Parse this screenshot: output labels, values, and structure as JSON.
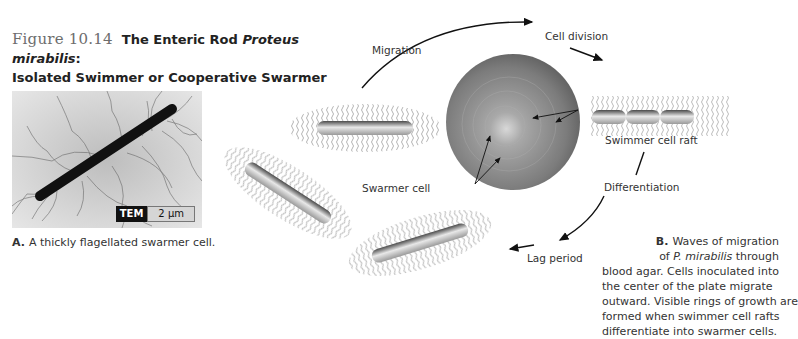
{
  "figure": {
    "number": "Figure 10.14",
    "title_prefix": "The Enteric Rod ",
    "title_italic": "Proteus mirabilis",
    "title_suffix": ":",
    "title_line2": "Isolated Swimmer or Cooperative Swarmer"
  },
  "panel_a": {
    "badge_method": "TEM",
    "badge_scale": "2 μm",
    "caption_letter": "A.",
    "caption_text": "A thickly flagellated swarmer cell."
  },
  "cycle_labels": {
    "migration": "Migration",
    "cell_division": "Cell division",
    "swimmer_cell_raft": "Swimmer cell raft",
    "differentiation": "Differentiation",
    "lag_period": "Lag period",
    "swarmer_cell": "Swarmer cell"
  },
  "panel_b": {
    "caption_letter": "B.",
    "caption_line1": "Waves of migration",
    "caption_line2_prefix": "of ",
    "caption_line2_italic": "P. mirabilis",
    "caption_line2_suffix": " through",
    "caption_line3": "blood agar. Cells inoculated into",
    "caption_line4": "the center of the plate migrate",
    "caption_line5": "outward. Visible rings of growth are",
    "caption_line6": "formed when swimmer cell rafts",
    "caption_line7": "differentiate into swarmer cells."
  },
  "colors": {
    "figure_number": "#6d6d6d",
    "text": "#222222",
    "plate": "#8a8a8a",
    "flagella": "#9a9a9a",
    "tem_badge": "#111111"
  }
}
